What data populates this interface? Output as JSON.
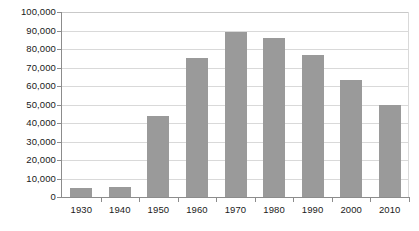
{
  "chart_data": {
    "type": "bar",
    "title": "",
    "subtitle": "",
    "xlabel": "",
    "ylabel": "",
    "categories": [
      "1930",
      "1940",
      "1950",
      "1960",
      "1970",
      "1980",
      "1990",
      "2000",
      "2010"
    ],
    "values": [
      5000,
      5500,
      44000,
      75000,
      89000,
      86000,
      77000,
      63000,
      50000
    ],
    "ylim": [
      0,
      100000
    ],
    "ytick_values": [
      0,
      10000,
      20000,
      30000,
      40000,
      50000,
      60000,
      70000,
      80000,
      90000,
      100000
    ],
    "ytick_labels": [
      "0",
      "10,000",
      "20,000",
      "30,000",
      "40,000",
      "50,000",
      "60,000",
      "70,000",
      "80,000",
      "90,000",
      "100,000"
    ],
    "grid": true,
    "grid_axis": "y",
    "legend": false,
    "legend_position": "none",
    "series": [
      {
        "name": "",
        "values": [
          5000,
          5500,
          44000,
          75000,
          89000,
          86000,
          77000,
          63000,
          50000
        ]
      }
    ],
    "colors": {
      "bar_fill": "#9a9a9a",
      "gridline": "#d9d9d9",
      "axis_line": "#8c8c8c",
      "tick_label": "#1a1a1a",
      "background": "#ffffff"
    }
  }
}
